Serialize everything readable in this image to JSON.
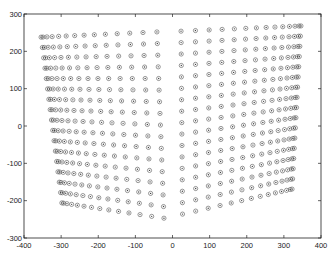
{
  "chart_data": {
    "type": "scatter",
    "title": "",
    "xlabel": "",
    "ylabel": "",
    "xlim": [
      -400,
      400
    ],
    "ylim": [
      -300,
      300
    ],
    "grid": false,
    "legend": null,
    "xticks": [
      -400,
      -300,
      -200,
      -100,
      0,
      100,
      200,
      300,
      400
    ],
    "yticks": [
      -300,
      -200,
      -100,
      0,
      100,
      200,
      300
    ],
    "marker": "circle-dot",
    "series": [
      {
        "name": "left-grid",
        "rows": 17,
        "cols": 14,
        "spacing_exponent": 1.6,
        "outer_top": [
          -354,
          238
        ],
        "outer_bottom": [
          -298,
          -206
        ],
        "inner_top": [
          -42,
          252
        ],
        "inner_bottom": [
          -23,
          -247
        ]
      },
      {
        "name": "right-grid",
        "rows": 17,
        "cols": 14,
        "spacing_exponent": 1.6,
        "outer_top": [
          346,
          268
        ],
        "outer_bottom": [
          322,
          -169
        ],
        "inner_top": [
          23,
          254
        ],
        "inner_bottom": [
          27,
          -236
        ]
      }
    ]
  },
  "axes": {
    "x_tick_labels": [
      "-400",
      "-300",
      "-200",
      "-100",
      "0",
      "100",
      "200",
      "300",
      "400"
    ],
    "y_tick_labels": [
      "300",
      "200",
      "100",
      "0",
      "-100",
      "-200",
      "-300"
    ]
  },
  "layout": {
    "frame_px": {
      "left": 24,
      "right": 321,
      "top": 14,
      "bottom": 238
    },
    "marker_color": "#444444",
    "axis_color": "#222222"
  }
}
